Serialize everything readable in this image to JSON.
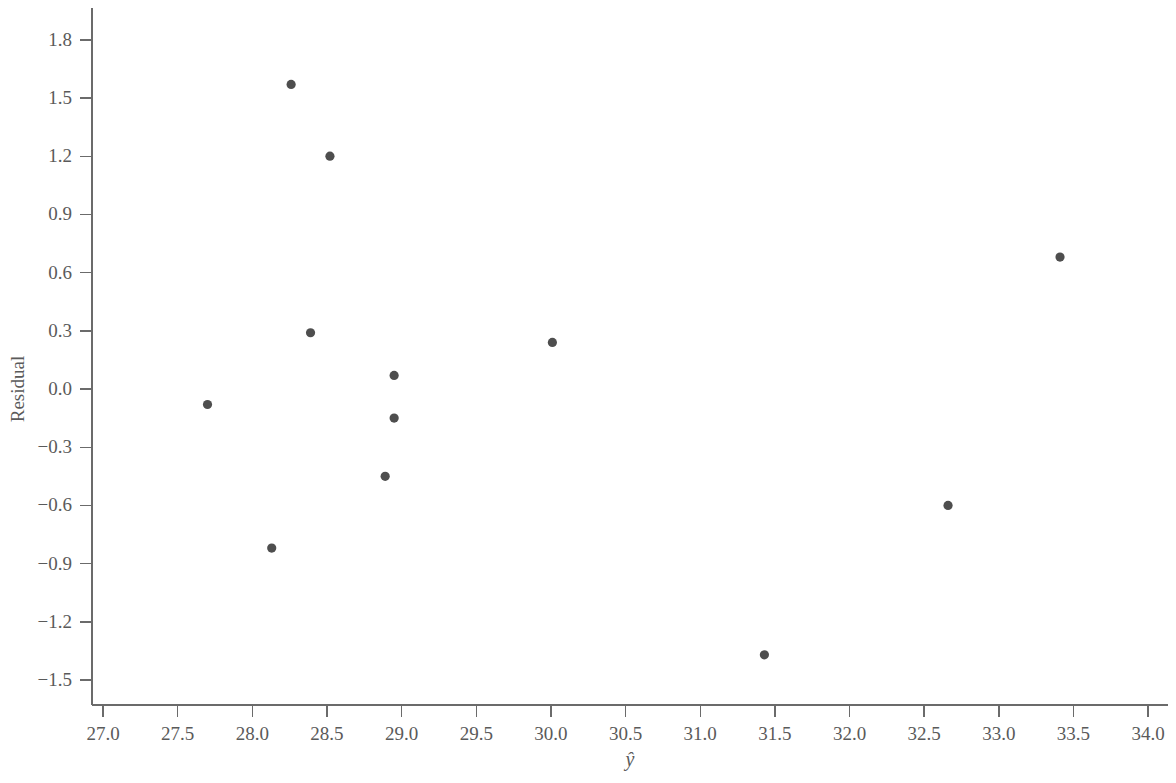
{
  "chart_data": {
    "type": "scatter",
    "title": "",
    "xlabel": "ŷ",
    "ylabel": "Residual",
    "xlim": [
      26.78,
      34.18
    ],
    "ylim": [
      -1.63,
      1.88
    ],
    "grid": false,
    "legend": false,
    "marker_color": "#4e4e4e",
    "axis_color": "#6b6b6b",
    "background_color": "#ffffff",
    "xticks": [
      "27.0",
      "27.5",
      "28.0",
      "28.5",
      "29.0",
      "29.5",
      "30.0",
      "30.5",
      "31.0",
      "31.5",
      "32.0",
      "32.5",
      "33.0",
      "33.5",
      "34.0"
    ],
    "xtick_values": [
      27.0,
      27.5,
      28.0,
      28.5,
      29.0,
      29.5,
      30.0,
      30.5,
      31.0,
      31.5,
      32.0,
      32.5,
      33.0,
      33.5,
      34.0
    ],
    "yticks": [
      "1.8",
      "1.5",
      "1.2",
      "0.9",
      "0.6",
      "0.3",
      "0.0",
      "−0.3",
      "−0.6",
      "−0.9",
      "−1.2",
      "−1.5"
    ],
    "ytick_values": [
      1.8,
      1.5,
      1.2,
      0.9,
      0.6,
      0.3,
      0.0,
      -0.3,
      -0.6,
      -0.9,
      -1.2,
      -1.5
    ],
    "points": [
      {
        "x": 27.7,
        "y": -0.08
      },
      {
        "x": 28.13,
        "y": -0.82
      },
      {
        "x": 28.26,
        "y": 1.57
      },
      {
        "x": 28.39,
        "y": 0.29
      },
      {
        "x": 28.52,
        "y": 1.2
      },
      {
        "x": 28.89,
        "y": -0.45
      },
      {
        "x": 28.95,
        "y": 0.07
      },
      {
        "x": 28.95,
        "y": -0.15
      },
      {
        "x": 30.01,
        "y": 0.24
      },
      {
        "x": 31.43,
        "y": -1.37
      },
      {
        "x": 32.66,
        "y": -0.6
      },
      {
        "x": 33.41,
        "y": 0.68
      }
    ]
  }
}
